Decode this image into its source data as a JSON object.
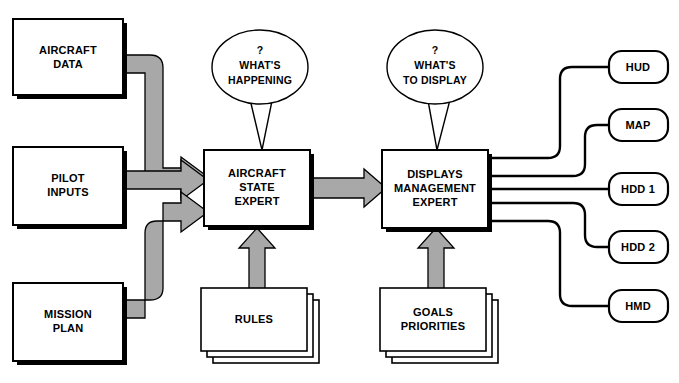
{
  "diagram": {
    "colors": {
      "arrow_fill": "#a8a8a8",
      "stroke": "#000000",
      "background": "#ffffff"
    },
    "sources": [
      {
        "id": "aircraft-data",
        "line1": "AIRCRAFT",
        "line2": "DATA"
      },
      {
        "id": "pilot-inputs",
        "line1": "PILOT",
        "line2": "INPUTS"
      },
      {
        "id": "mission-plan",
        "line1": "MISSION",
        "line2": "PLAN"
      }
    ],
    "experts": [
      {
        "id": "aircraft-state-expert",
        "line1": "AIRCRAFT",
        "line2": "STATE",
        "line3": "EXPERT"
      },
      {
        "id": "displays-management-expert",
        "line1": "DISPLAYS",
        "line2": "MANAGEMENT",
        "line3": "EXPERT"
      }
    ],
    "bubbles": [
      {
        "id": "whats-happening",
        "line1": "?",
        "line2": "WHAT'S",
        "line3": "HAPPENING"
      },
      {
        "id": "whats-to-display",
        "line1": "?",
        "line2": "WHAT'S",
        "line3": "TO DISPLAY"
      }
    ],
    "knowledge_stacks": [
      {
        "id": "rules",
        "line1": "RULES",
        "line2": ""
      },
      {
        "id": "goals-priorities",
        "line1": "GOALS",
        "line2": "PRIORITIES"
      }
    ],
    "outputs": [
      {
        "id": "hud",
        "label": "HUD"
      },
      {
        "id": "map",
        "label": "MAP"
      },
      {
        "id": "hdd-1",
        "label": "HDD 1"
      },
      {
        "id": "hdd-2",
        "label": "HDD 2"
      },
      {
        "id": "hmd",
        "label": "HMD"
      }
    ]
  }
}
